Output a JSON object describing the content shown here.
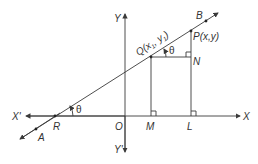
{
  "diagram": {
    "type": "coordinate-geometry",
    "colors": {
      "line": "#3a3a3a",
      "text": "#333333",
      "background": "#ffffff"
    },
    "axes": {
      "x_label": "X",
      "x_neg_label": "X'",
      "y_label": "Y",
      "y_neg_label": "Y'",
      "origin_label": "O"
    },
    "points": {
      "A": "A",
      "B": "B",
      "R": "R",
      "Q": "Q(x",
      "Q_sub1": "1",
      "Q_mid": ", y",
      "Q_sub2": "1",
      "Q_end": ")",
      "P": "P(x,y)",
      "N": "N",
      "M": "M",
      "L": "L"
    },
    "angles": {
      "at_R": "θ",
      "at_Q": "θ"
    }
  }
}
